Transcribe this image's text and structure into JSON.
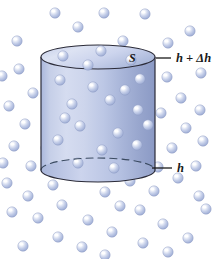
{
  "figure": {
    "background_color": "#ffffff",
    "width": 213,
    "height": 259
  },
  "labels": {
    "area_label": "S",
    "top_height_label": "h + Δh",
    "bottom_height_label": "h"
  },
  "colors": {
    "cylinder_light": "#dfe5f4",
    "cylinder_mid": "#b9c4e2",
    "cylinder_dark": "#8e9cc6",
    "cylinder_outline": "#2b2b38",
    "sphere_fill": "#b9c6e4",
    "sphere_highlight": "#ffffff",
    "sphere_edge": "#8c9ac2",
    "leader_line": "#1a1a1a",
    "dashed_arc": "#3a4a60"
  },
  "cylinder": {
    "center_x": 98,
    "radius_x": 57,
    "top_center_y": 57,
    "bottom_center_y": 170,
    "radius_y": 12
  },
  "leaders": {
    "top": {
      "x1": 156,
      "y1": 58,
      "x2": 171,
      "y2": 58,
      "label_x": 176,
      "label_y": 62
    },
    "bottom": {
      "x1": 152,
      "y1": 168,
      "x2": 172,
      "y2": 168,
      "label_x": 177,
      "label_y": 172
    }
  },
  "molecules": {
    "radius": 5.2,
    "outside": [
      [
        17,
        41
      ],
      [
        55,
        13
      ],
      [
        104,
        13
      ],
      [
        145,
        14
      ],
      [
        190,
        31
      ],
      [
        78,
        27
      ],
      [
        123,
        41
      ],
      [
        168,
        43
      ],
      [
        201,
        73
      ],
      [
        19,
        69
      ],
      [
        33,
        93
      ],
      [
        9,
        106
      ],
      [
        25,
        124
      ],
      [
        14,
        146
      ],
      [
        31,
        166
      ],
      [
        7,
        183
      ],
      [
        46,
        148
      ],
      [
        167,
        77
      ],
      [
        181,
        98
      ],
      [
        200,
        110
      ],
      [
        161,
        113
      ],
      [
        186,
        128
      ],
      [
        203,
        141
      ],
      [
        172,
        148
      ],
      [
        158,
        167
      ],
      [
        53,
        185
      ],
      [
        80,
        176
      ],
      [
        105,
        192
      ],
      [
        130,
        181
      ],
      [
        154,
        191
      ],
      [
        178,
        178
      ],
      [
        199,
        196
      ],
      [
        120,
        206
      ],
      [
        28,
        196
      ],
      [
        12,
        212
      ],
      [
        38,
        218
      ],
      [
        62,
        205
      ],
      [
        88,
        220
      ],
      [
        112,
        232
      ],
      [
        140,
        210
      ],
      [
        163,
        224
      ],
      [
        188,
        238
      ],
      [
        58,
        237
      ],
      [
        82,
        247
      ],
      [
        105,
        255
      ],
      [
        23,
        246
      ],
      [
        143,
        243
      ],
      [
        168,
        252
      ],
      [
        196,
        166
      ],
      [
        206,
        209
      ],
      [
        3,
        163
      ],
      [
        127,
        130
      ],
      [
        2,
        76
      ]
    ],
    "inside": [
      [
        63,
        56
      ],
      [
        101,
        51
      ],
      [
        131,
        60
      ],
      [
        60,
        80
      ],
      [
        93,
        87
      ],
      [
        72,
        104
      ],
      [
        110,
        100
      ],
      [
        140,
        79
      ],
      [
        138,
        110
      ],
      [
        80,
        126
      ],
      [
        118,
        133
      ],
      [
        58,
        140
      ],
      [
        102,
        150
      ],
      [
        137,
        145
      ],
      [
        78,
        163
      ],
      [
        114,
        168
      ],
      [
        88,
        65
      ],
      [
        125,
        90
      ],
      [
        65,
        118
      ],
      [
        148,
        125
      ]
    ]
  }
}
